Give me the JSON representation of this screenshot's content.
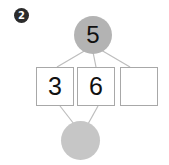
{
  "worksheet": {
    "item_number": "2",
    "colors": {
      "top_circle_fill": "#b3b3b3",
      "bottom_circle_fill": "#c6c6c6",
      "box_border": "#a8a8a8",
      "connector_line": "#bdbdbd",
      "text": "#111111",
      "background": "#ffffff"
    }
  },
  "number_bond": {
    "top_node": {
      "label": "top-total",
      "value": "5",
      "shape": "circle",
      "filled": true
    },
    "bottom_node": {
      "label": "bottom-total",
      "value": "",
      "shape": "circle",
      "filled": true
    },
    "boxes": [
      {
        "id": "box-1",
        "value": "3",
        "empty": false
      },
      {
        "id": "box-2",
        "value": "6",
        "empty": false
      },
      {
        "id": "box-3",
        "value": "",
        "empty": true
      }
    ],
    "connections": {
      "from_top": [
        "box-1",
        "box-2",
        "box-3"
      ],
      "from_bottom": [
        "box-1",
        "box-2"
      ]
    }
  }
}
